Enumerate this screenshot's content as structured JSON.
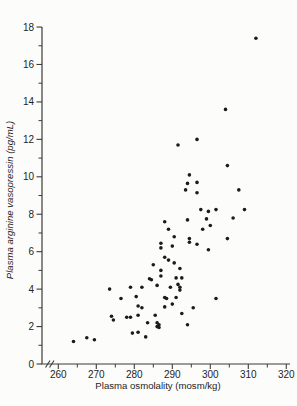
{
  "figure": {
    "background": "#fcfcfa",
    "axis_color": "#3b3b3b",
    "text_color": "#242424"
  },
  "chart_data": {
    "type": "scatter",
    "title": "",
    "xlabel": "Plasma osmolality (mosm/kg)",
    "ylabel": "Plasma arginine vasopressin (pg/mL)",
    "xlim": [
      256,
      321
    ],
    "ylim": [
      0,
      18
    ],
    "x_ticks": [
      260,
      270,
      280,
      290,
      300,
      310,
      320
    ],
    "y_ticks": [
      0,
      2,
      4,
      6,
      8,
      10,
      12,
      14,
      16,
      18
    ],
    "x_minor_step": 5,
    "y_minor_step": 1,
    "x_axis_break_at_origin": true,
    "grid": false,
    "legend": null,
    "marker": {
      "shape": "circle",
      "size_px": 3.6,
      "color": "#1b1b1b"
    },
    "points": [
      [
        312,
        17.4
      ],
      [
        304,
        13.6
      ],
      [
        296.5,
        12.0
      ],
      [
        291.5,
        11.7
      ],
      [
        304.5,
        10.6
      ],
      [
        294.5,
        10.1
      ],
      [
        296.5,
        9.7
      ],
      [
        294,
        9.65
      ],
      [
        307.5,
        9.3
      ],
      [
        293.5,
        9.3
      ],
      [
        296.5,
        9.15
      ],
      [
        297.5,
        8.25
      ],
      [
        301.5,
        8.25
      ],
      [
        309,
        8.25
      ],
      [
        299.5,
        8.15
      ],
      [
        306,
        7.8
      ],
      [
        299,
        7.75
      ],
      [
        294,
        7.7
      ],
      [
        288,
        7.6
      ],
      [
        300,
        7.4
      ],
      [
        289,
        7.2
      ],
      [
        298,
        7.2
      ],
      [
        290.5,
        6.8
      ],
      [
        294.5,
        6.7
      ],
      [
        304.5,
        6.7
      ],
      [
        294.5,
        6.5
      ],
      [
        287,
        6.45
      ],
      [
        296.5,
        6.4
      ],
      [
        290,
        6.3
      ],
      [
        287,
        6.2
      ],
      [
        299.5,
        6.1
      ],
      [
        288,
        5.7
      ],
      [
        289,
        5.55
      ],
      [
        290.5,
        5.4
      ],
      [
        285,
        5.3
      ],
      [
        292,
        5.1
      ],
      [
        287,
        5.0
      ],
      [
        287,
        4.7
      ],
      [
        291,
        4.6
      ],
      [
        292.5,
        4.6
      ],
      [
        284,
        4.55
      ],
      [
        284.5,
        4.5
      ],
      [
        291.5,
        4.25
      ],
      [
        286,
        4.2
      ],
      [
        282,
        4.1
      ],
      [
        289.5,
        4.1
      ],
      [
        292,
        4.1
      ],
      [
        279,
        4.1
      ],
      [
        273.5,
        4.0
      ],
      [
        292,
        3.95
      ],
      [
        280.5,
        3.6
      ],
      [
        288,
        3.55
      ],
      [
        291,
        3.55
      ],
      [
        288.5,
        3.5
      ],
      [
        301.5,
        3.5
      ],
      [
        276.5,
        3.5
      ],
      [
        290,
        3.2
      ],
      [
        281,
        3.1
      ],
      [
        288,
        3.05
      ],
      [
        282,
        3.0
      ],
      [
        295.5,
        3.0
      ],
      [
        292.5,
        2.7
      ],
      [
        281,
        2.6
      ],
      [
        285.5,
        2.6
      ],
      [
        274,
        2.55
      ],
      [
        278,
        2.5
      ],
      [
        279,
        2.5
      ],
      [
        274.5,
        2.35
      ],
      [
        283.5,
        2.2
      ],
      [
        286,
        2.2
      ],
      [
        286.5,
        2.1
      ],
      [
        294,
        2.1
      ],
      [
        286,
        2.0
      ],
      [
        286.5,
        1.95
      ],
      [
        281,
        1.7
      ],
      [
        279.5,
        1.65
      ],
      [
        283,
        1.45
      ],
      [
        267.5,
        1.4
      ],
      [
        269.5,
        1.3
      ],
      [
        264,
        1.2
      ]
    ]
  }
}
